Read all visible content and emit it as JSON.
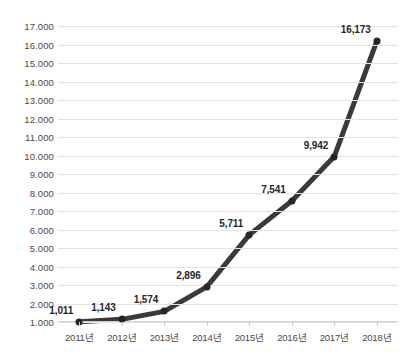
{
  "chart_data": {
    "type": "line",
    "title": "",
    "subtitle": "",
    "xlabel": "",
    "ylabel": "",
    "categories": [
      "2011년",
      "2012년",
      "2013년",
      "2014년",
      "2015년",
      "2016년",
      "2017년",
      "2018년"
    ],
    "values": [
      1011,
      1143,
      1574,
      2896,
      5711,
      7541,
      9942,
      16173
    ],
    "point_labels": [
      "1,011",
      "1,143",
      "1,574",
      "2,896",
      "5,711",
      "7,541",
      "9,942",
      "16,173"
    ],
    "ylim": [
      1000,
      17000
    ],
    "y_ticks": [
      1000,
      2000,
      3000,
      4000,
      5000,
      6000,
      7000,
      8000,
      9000,
      10000,
      11000,
      12000,
      13000,
      14000,
      15000,
      16000,
      17000
    ],
    "y_tick_labels": [
      "1.000",
      "2.000",
      "3.000",
      "4.000",
      "5.000",
      "6.000",
      "7.000",
      "8.000",
      "9.000",
      "10.000",
      "11.000",
      "12.000",
      "13.000",
      "14.000",
      "15.000",
      "16.000",
      "17.000"
    ],
    "grid": true,
    "legend": "none",
    "series": [
      {
        "name": "",
        "values": [
          1011,
          1143,
          1574,
          2896,
          5711,
          7541,
          9942,
          16173
        ]
      }
    ],
    "colors": {
      "line": "#3a3a3a",
      "marker": "#262626",
      "gridline": "#e3e3e3",
      "axis": "#cfcfcf",
      "label_text": "#4a4a4a",
      "data_label_text": "#262626",
      "background": "#ffffff"
    }
  }
}
